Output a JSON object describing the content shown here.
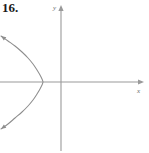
{
  "figure": {
    "problem_number": "16.",
    "axis_labels": {
      "x": "x",
      "y": "y"
    },
    "colors": {
      "axis": "#9a9a9a",
      "curve": "#8d8d8d",
      "label_text": "#1a1a1a",
      "axis_label_text": "#6b6b6b",
      "background": "#ffffff"
    }
  },
  "chart_data": {
    "type": "line",
    "title": "16.",
    "xlabel": "x",
    "ylabel": "y",
    "grid": false,
    "legend": null,
    "xlim": [
      -6.1,
      5.5
    ],
    "ylim": [
      -7.3,
      8.0
    ],
    "origin_px": [
      61,
      82
    ],
    "axes": [
      {
        "name": "x-axis",
        "from_px": [
          0,
          82
        ],
        "to_px": [
          144,
          82
        ],
        "arrow": "right"
      },
      {
        "name": "y-axis",
        "from_px": [
          61,
          150
        ],
        "to_px": [
          61,
          5
        ],
        "arrow": "up"
      }
    ],
    "series": [
      {
        "name": "parabola",
        "opens": "left",
        "vertex_px": [
          43,
          82
        ],
        "vertex": [
          -2.0,
          0.0
        ],
        "points_px": [
          [
            1,
            36
          ],
          [
            8,
            41
          ],
          [
            15,
            46
          ],
          [
            22,
            52
          ],
          [
            28,
            58
          ],
          [
            33,
            64
          ],
          [
            37,
            70
          ],
          [
            40,
            75
          ],
          [
            42,
            79
          ],
          [
            43,
            82
          ],
          [
            42,
            85
          ],
          [
            40,
            89
          ],
          [
            37,
            94
          ],
          [
            33,
            100
          ],
          [
            28,
            106
          ],
          [
            22,
            112
          ],
          [
            15,
            118
          ],
          [
            8,
            124
          ],
          [
            1,
            129
          ]
        ],
        "arrowheads_px": [
          [
            1,
            36
          ],
          [
            1,
            129
          ]
        ]
      }
    ]
  }
}
